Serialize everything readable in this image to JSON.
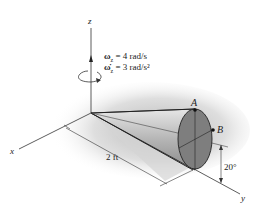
{
  "figure": {
    "axes": {
      "z_label": "z",
      "x_label": "x",
      "y_label": "y"
    },
    "angular_velocity": {
      "symbol": "ω",
      "subscript": "z",
      "value_text": " = 4 rad/s"
    },
    "angular_acceleration": {
      "symbol": "ω̇",
      "subscript": "z",
      "value_text": " = 3 rad/s²"
    },
    "points": {
      "a_label": "A",
      "b_label": "B"
    },
    "dimensions": {
      "length_label": "2 ft",
      "angle_label": "20°"
    },
    "colors": {
      "cone_base": "#7a7a7a",
      "cone_body": "#b8b8b8",
      "shadow": "#c8c8c8",
      "lines": "#333333"
    }
  }
}
